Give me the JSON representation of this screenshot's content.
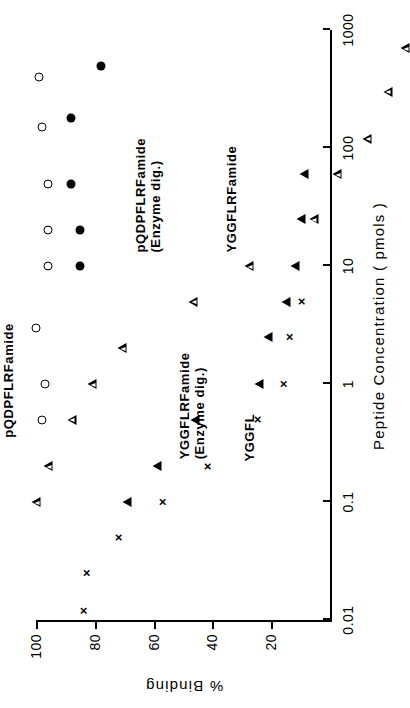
{
  "figure": {
    "orientation_note": "rotated",
    "background": "#ffffff",
    "ink_color": "#000000"
  },
  "chart_data": {
    "type": "scatter",
    "title": "",
    "subtitle": "",
    "xlabel": "Peptide  Concentration ( pmols )",
    "ylabel": "%   Binding",
    "x_scale": "log",
    "y_scale": "linear",
    "xlim": [
      0.01,
      1000
    ],
    "ylim": [
      0,
      100
    ],
    "grid": false,
    "legend_position": "in-plot annotations",
    "x_ticks": [
      0.01,
      0.1,
      1,
      10,
      100,
      1000
    ],
    "x_tick_labels": [
      "0.01",
      "0.1",
      "1",
      "10",
      "100",
      "1000"
    ],
    "y_ticks": [
      20,
      40,
      60,
      80,
      100
    ],
    "y_tick_labels": [
      "20",
      "40",
      "60",
      "80",
      "100"
    ],
    "series": [
      {
        "name": "pQDPFLRFamide",
        "marker": "open-circle",
        "points": [
          {
            "x": 0.5,
            "y": 98
          },
          {
            "x": 1.0,
            "y": 97
          },
          {
            "x": 3.0,
            "y": 100
          },
          {
            "x": 10.0,
            "y": 96
          },
          {
            "x": 20.0,
            "y": 96
          },
          {
            "x": 50.0,
            "y": 96
          },
          {
            "x": 150.0,
            "y": 98
          },
          {
            "x": 400.0,
            "y": 99
          }
        ]
      },
      {
        "name": "pQDPFLRFamide (Enzyme dig.)",
        "marker": "filled-circle",
        "points": [
          {
            "x": 10.0,
            "y": 85
          },
          {
            "x": 20.0,
            "y": 85
          },
          {
            "x": 50.0,
            "y": 88
          },
          {
            "x": 180.0,
            "y": 88
          },
          {
            "x": 500.0,
            "y": 78
          }
        ]
      },
      {
        "name": "YGGFLRFamide",
        "marker": "open-triangle",
        "points": [
          {
            "x": 0.1,
            "y": 100
          },
          {
            "x": 0.2,
            "y": 99
          },
          {
            "x": 0.5,
            "y": 94
          },
          {
            "x": 1.0,
            "y": 90
          },
          {
            "x": 2.0,
            "y": 83
          },
          {
            "x": 5.0,
            "y": 62
          },
          {
            "x": 10.0,
            "y": 46
          },
          {
            "x": 25.0,
            "y": 27
          },
          {
            "x": 60.0,
            "y": 22
          },
          {
            "x": 120.0,
            "y": 15
          },
          {
            "x": 300.0,
            "y": 11
          },
          {
            "x": 700.0,
            "y": 8
          }
        ]
      },
      {
        "name": "YGGFLRFamide (Enzyme dig.)",
        "marker": "filled-triangle",
        "points": [
          {
            "x": 0.1,
            "y": 69
          },
          {
            "x": 0.2,
            "y": 59
          },
          {
            "x": 0.5,
            "y": 46
          },
          {
            "x": 1.0,
            "y": 24
          },
          {
            "x": 2.5,
            "y": 21
          },
          {
            "x": 5.0,
            "y": 15
          },
          {
            "x": 10.0,
            "y": 12
          },
          {
            "x": 25.0,
            "y": 10
          },
          {
            "x": 60.0,
            "y": 9
          }
        ]
      },
      {
        "name": "YGGFL",
        "marker": "cross",
        "points": [
          {
            "x": 0.012,
            "y": 84
          },
          {
            "x": 0.025,
            "y": 83
          },
          {
            "x": 0.05,
            "y": 72
          },
          {
            "x": 0.1,
            "y": 57
          },
          {
            "x": 0.2,
            "y": 42
          },
          {
            "x": 0.5,
            "y": 25
          },
          {
            "x": 1.0,
            "y": 16
          },
          {
            "x": 2.5,
            "y": 14
          },
          {
            "x": 5.0,
            "y": 10
          }
        ]
      }
    ],
    "annotations": [
      {
        "text": "pQDPFLRFamide",
        "x": 0.35,
        "y": 112
      },
      {
        "text": "pQDPFLRFamide\n(Enzyme dig.)",
        "x": 13.0,
        "y": 67
      },
      {
        "text": "YGGFLRFamide",
        "x": 13.0,
        "y": 36
      },
      {
        "text": "YGGFLRFamide\n(Enzyme dig.)",
        "x": 0.23,
        "y": 52
      },
      {
        "text": "YGGFL",
        "x": 0.22,
        "y": 30
      }
    ]
  },
  "labels": {
    "x_axis_title": "Peptide  Concentration ( pmols )",
    "y_axis_title": "%   Binding",
    "series_pqdpflrfamide": "pQDPFLRFamide",
    "series_pqdpflrfamide_enzyme_line1": "pQDPFLRFamide",
    "series_pqdpflrfamide_enzyme_line2": "(Enzyme dig.)",
    "series_yggflrfamide": "YGGFLRFamide",
    "series_yggflrfamide_enzyme_line1": "YGGFLRFamide",
    "series_yggflrfamide_enzyme_line2": "(Enzyme dig.)",
    "series_yggfl": "YGGFL",
    "tick_x_0": "0.01",
    "tick_x_1": "0.1",
    "tick_x_2": "1",
    "tick_x_3": "10",
    "tick_x_4": "100",
    "tick_x_5": "1000",
    "tick_y_0": "20",
    "tick_y_1": "40",
    "tick_y_2": "60",
    "tick_y_3": "80",
    "tick_y_4": "100"
  }
}
